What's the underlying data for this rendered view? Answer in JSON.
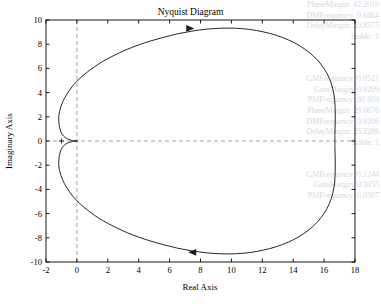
{
  "figure": {
    "title": "Nyquist Diagram",
    "background_color": "#ffffff",
    "plot_box_color": "#000000",
    "curve_color": "#1a1a1a",
    "grid_dash_color": "#9a9a9a"
  },
  "ghost_text": {
    "note": "faint bleed-through text at right edge",
    "color": "#d8d8dc",
    "lines": [
      "PhaseMargin: 42.2016",
      "DMFrequency: 0.6464",
      "DelayMargin: 20.8575",
      "Stable: 1",
      "",
      "",
      "",
      "GMFrequency: 0.0521",
      "GainMargin: 0.0209",
      "PMFrequency: 60.604",
      "PhaseMargin: 29.6876",
      "DMFrequency: 0.0206",
      "DelayMargin: 25.2286",
      "Stable: 1",
      "",
      "",
      "GMFrequency: 0.1244",
      "GainMargin: 0.3455",
      "PMFrequency: 0.0507"
    ]
  },
  "chart_data": {
    "type": "line",
    "title": "Nyquist Diagram",
    "xlabel": "Real Axis",
    "ylabel": "Imaginary Axis",
    "xlim": [
      -2,
      18
    ],
    "ylim": [
      -10,
      10
    ],
    "xticks": [
      -2,
      0,
      2,
      4,
      6,
      8,
      10,
      12,
      14,
      16,
      18
    ],
    "yticks": [
      -10,
      -8,
      -6,
      -4,
      -2,
      0,
      2,
      4,
      6,
      8,
      10
    ],
    "grid": false,
    "legend": null,
    "reference_lines": [
      {
        "name": "zero-real-axis",
        "orientation": "vertical",
        "value": 0,
        "style": "dashed"
      },
      {
        "name": "zero-imaginary-axis",
        "orientation": "horizontal",
        "value": 0,
        "style": "dashed"
      }
    ],
    "critical_point": {
      "label": "+",
      "x": -1,
      "y": 0
    },
    "direction_arrows": [
      {
        "name": "upper-arrow",
        "x": 7.5,
        "y": 9.3,
        "direction": "right"
      },
      {
        "name": "lower-arrow",
        "x": 7.3,
        "y": -9.2,
        "direction": "left"
      }
    ],
    "series": [
      {
        "name": "nyquist-contour",
        "points_upper": [
          [
            0.02,
            0.0
          ],
          [
            -0.3,
            0.05
          ],
          [
            -0.62,
            0.18
          ],
          [
            -0.86,
            0.4
          ],
          [
            -1.02,
            0.72
          ],
          [
            -1.12,
            1.12
          ],
          [
            -1.17,
            1.6
          ],
          [
            -1.17,
            2.05
          ],
          [
            -1.12,
            2.45
          ],
          [
            -1.03,
            2.85
          ],
          [
            -0.9,
            3.28
          ],
          [
            -0.72,
            3.72
          ],
          [
            -0.5,
            4.16
          ],
          [
            -0.24,
            4.6
          ],
          [
            0.08,
            5.04
          ],
          [
            0.46,
            5.48
          ],
          [
            0.9,
            5.92
          ],
          [
            1.4,
            6.36
          ],
          [
            1.96,
            6.78
          ],
          [
            2.58,
            7.18
          ],
          [
            3.26,
            7.58
          ],
          [
            4.0,
            7.94
          ],
          [
            4.8,
            8.28
          ],
          [
            5.64,
            8.58
          ],
          [
            6.52,
            8.86
          ],
          [
            7.44,
            9.08
          ],
          [
            8.38,
            9.24
          ],
          [
            9.32,
            9.32
          ],
          [
            10.26,
            9.32
          ],
          [
            11.18,
            9.22
          ],
          [
            12.06,
            9.02
          ],
          [
            12.9,
            8.74
          ],
          [
            13.68,
            8.36
          ],
          [
            14.38,
            7.9
          ],
          [
            15.02,
            7.34
          ],
          [
            15.56,
            6.7
          ],
          [
            16.0,
            5.98
          ],
          [
            16.34,
            5.18
          ],
          [
            16.56,
            4.32
          ],
          [
            16.68,
            3.42
          ],
          [
            16.72,
            2.5
          ],
          [
            16.72,
            1.56
          ],
          [
            16.7,
            0.62
          ],
          [
            16.7,
            0.0
          ]
        ]
      }
    ]
  },
  "axis_tick_labels": {
    "x": [
      "-2",
      "0",
      "2",
      "4",
      "6",
      "8",
      "10",
      "12",
      "14",
      "16",
      "18"
    ],
    "y": [
      "10",
      "8",
      "6",
      "4",
      "2",
      "0",
      "-2",
      "-4",
      "-6",
      "-8",
      "-10"
    ]
  }
}
